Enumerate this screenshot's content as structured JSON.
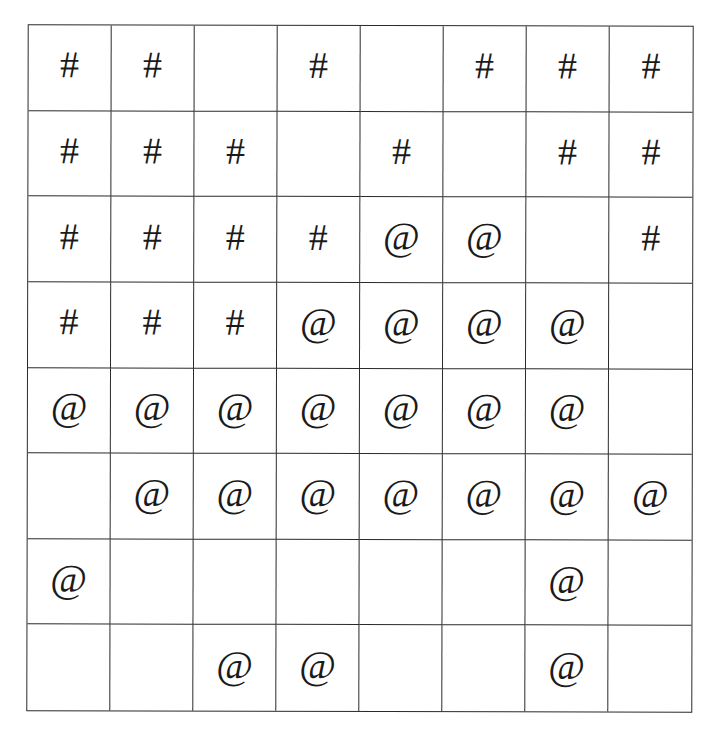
{
  "grid": {
    "rows": 8,
    "cols": 8,
    "line_color": "#2a2a2a",
    "symbols": {
      "hash": "#",
      "at": "@",
      "empty": ""
    },
    "cells": [
      [
        "#",
        "#",
        "",
        "#",
        "",
        "#",
        "#",
        "#"
      ],
      [
        "#",
        "#",
        "#",
        "",
        "#",
        "",
        "#",
        "#"
      ],
      [
        "#",
        "#",
        "#",
        "#",
        "@",
        "@",
        "",
        "#"
      ],
      [
        "#",
        "#",
        "#",
        "@",
        "@",
        "@",
        "@",
        ""
      ],
      [
        "@",
        "@",
        "@",
        "@",
        "@",
        "@",
        "@",
        ""
      ],
      [
        "",
        "@",
        "@",
        "@",
        "@",
        "@",
        "@",
        "@"
      ],
      [
        "@",
        "",
        "",
        "",
        "",
        "",
        "@",
        ""
      ],
      [
        "",
        "",
        "@",
        "@",
        "",
        "",
        "@",
        ""
      ]
    ]
  }
}
